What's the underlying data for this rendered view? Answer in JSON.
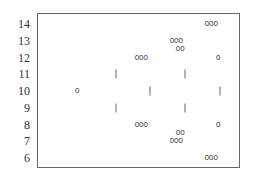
{
  "chart_data": {
    "type": "scatter",
    "title": "",
    "xlabel": "",
    "ylabel": "",
    "ylim": [
      6,
      14
    ],
    "yticks": [
      "14",
      "13",
      "12",
      "11",
      "10",
      "9",
      "8",
      "7",
      "6"
    ],
    "grid": false,
    "legend": null,
    "markers": [
      {
        "label": "o",
        "kind": "text",
        "x": 77,
        "y": 10
      },
      {
        "label": "|",
        "kind": "bar",
        "x": 116,
        "y": 11
      },
      {
        "label": "|",
        "kind": "bar",
        "x": 116,
        "y": 9
      },
      {
        "label": "ooo",
        "kind": "text",
        "x": 141,
        "y": 12
      },
      {
        "label": "ooo",
        "kind": "text",
        "x": 141,
        "y": 8
      },
      {
        "label": "|",
        "kind": "bar",
        "x": 150,
        "y": 10
      },
      {
        "label": "ooo",
        "kind": "text",
        "x": 176,
        "y": 13
      },
      {
        "label": "oo",
        "kind": "text",
        "x": 180,
        "y": 12.5
      },
      {
        "label": "ooo",
        "kind": "text",
        "x": 176,
        "y": 7
      },
      {
        "label": "oo",
        "kind": "text",
        "x": 180,
        "y": 7.5
      },
      {
        "label": "|",
        "kind": "bar",
        "x": 185,
        "y": 11
      },
      {
        "label": "|",
        "kind": "bar",
        "x": 185,
        "y": 9
      },
      {
        "label": "ooo",
        "kind": "text",
        "x": 211,
        "y": 14
      },
      {
        "label": "ooo",
        "kind": "text",
        "x": 211,
        "y": 6
      },
      {
        "label": "o",
        "kind": "text",
        "x": 218,
        "y": 12
      },
      {
        "label": "o",
        "kind": "text",
        "x": 218,
        "y": 8
      },
      {
        "label": "|",
        "kind": "bar",
        "x": 220,
        "y": 10
      }
    ]
  }
}
